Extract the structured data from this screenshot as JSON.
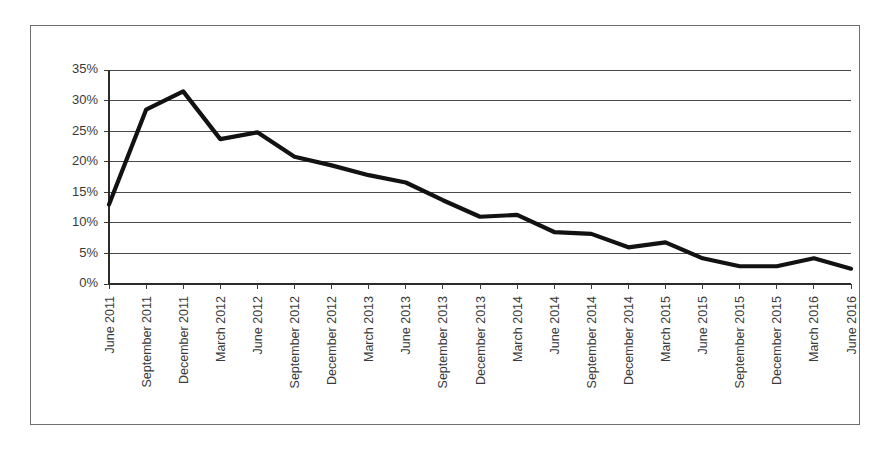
{
  "chart_data": {
    "type": "line",
    "title": "",
    "subtitle": "",
    "xlabel": "",
    "ylabel": "",
    "ylim": [
      0,
      35
    ],
    "ytick_labels": [
      "0%",
      "5%",
      "10%",
      "15%",
      "20%",
      "25%",
      "30%",
      "35%"
    ],
    "ytick_values": [
      0,
      5,
      10,
      15,
      20,
      25,
      30,
      35
    ],
    "grid": true,
    "legend": false,
    "legend_position": "none",
    "categories": [
      "June 2011",
      "September 2011",
      "December 2011",
      "March 2012",
      "June 2012",
      "September 2012",
      "December 2012",
      "March 2013",
      "June 2013",
      "September 2013",
      "December 2013",
      "March 2014",
      "June 2014",
      "September 2014",
      "December 2014",
      "March 2015",
      "June 2015",
      "September 2015",
      "December 2015",
      "March 2016",
      "June 2016"
    ],
    "values": [
      13.0,
      28.5,
      31.5,
      23.7,
      24.8,
      20.8,
      19.4,
      17.8,
      16.6,
      13.7,
      11.0,
      11.3,
      8.5,
      8.2,
      6.0,
      6.8,
      4.2,
      2.9,
      2.9,
      4.2,
      2.5
    ],
    "series": [
      {
        "name": "series-1",
        "color": "#121212",
        "values": [
          13.0,
          28.5,
          31.5,
          23.7,
          24.8,
          20.8,
          19.4,
          17.8,
          16.6,
          13.7,
          11.0,
          11.3,
          8.5,
          8.2,
          6.0,
          6.8,
          4.2,
          2.9,
          2.9,
          4.2,
          2.5
        ]
      }
    ]
  }
}
